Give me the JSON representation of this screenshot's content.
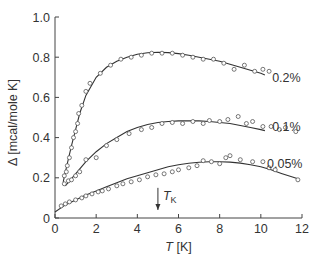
{
  "chart_data": {
    "type": "scatter",
    "title": "",
    "xlabel": "T [K]",
    "xlabel_italic": "T",
    "xlabel_unit": " [K]",
    "ylabel": "Δ [mcal/mole K]",
    "xlim": [
      0,
      12
    ],
    "ylim": [
      0,
      1.0
    ],
    "xticks": [
      0,
      2,
      4,
      6,
      8,
      10,
      12
    ],
    "xtick_labels": [
      "0",
      "2",
      "4",
      "6",
      "8",
      "10",
      "12"
    ],
    "yticks": [
      0,
      0.2,
      0.4,
      0.6,
      0.8,
      1.0
    ],
    "ytick_labels": [
      "0",
      "0.2",
      "0.4",
      "0.6",
      "0.8",
      "1.0"
    ],
    "grid": false,
    "annotations": [
      {
        "text": "T",
        "subscript": "K",
        "x": 5.0,
        "y_from": 0.15,
        "y_to": 0.04,
        "type": "arrow-down"
      }
    ],
    "series": [
      {
        "name": "0.2%",
        "points": [
          [
            0.45,
            0.21
          ],
          [
            0.55,
            0.23
          ],
          [
            0.6,
            0.26
          ],
          [
            0.7,
            0.3
          ],
          [
            0.8,
            0.35
          ],
          [
            0.9,
            0.4
          ],
          [
            1.0,
            0.43
          ],
          [
            1.1,
            0.47
          ],
          [
            1.15,
            0.52
          ],
          [
            1.3,
            0.56
          ],
          [
            1.5,
            0.63
          ],
          [
            1.7,
            0.67
          ],
          [
            2.2,
            0.72
          ],
          [
            2.7,
            0.76
          ],
          [
            3.2,
            0.79
          ],
          [
            3.7,
            0.8
          ],
          [
            4.2,
            0.81
          ],
          [
            4.7,
            0.82
          ],
          [
            5.2,
            0.82
          ],
          [
            5.7,
            0.82
          ],
          [
            6.2,
            0.81
          ],
          [
            6.7,
            0.8
          ],
          [
            7.2,
            0.79
          ],
          [
            7.7,
            0.79
          ],
          [
            8.2,
            0.77
          ],
          [
            8.7,
            0.74
          ],
          [
            9.2,
            0.76
          ],
          [
            9.7,
            0.73
          ],
          [
            10.1,
            0.74
          ],
          [
            10.4,
            0.73
          ]
        ],
        "curve": [
          [
            0.4,
            0.18
          ],
          [
            0.6,
            0.27
          ],
          [
            0.8,
            0.36
          ],
          [
            1.0,
            0.44
          ],
          [
            1.2,
            0.52
          ],
          [
            1.5,
            0.61
          ],
          [
            2.0,
            0.7
          ],
          [
            2.5,
            0.75
          ],
          [
            3.0,
            0.78
          ],
          [
            3.5,
            0.8
          ],
          [
            4.0,
            0.815
          ],
          [
            4.5,
            0.822
          ],
          [
            5.0,
            0.825
          ],
          [
            5.5,
            0.823
          ],
          [
            6.0,
            0.818
          ],
          [
            6.5,
            0.81
          ],
          [
            7.0,
            0.8
          ],
          [
            7.5,
            0.79
          ],
          [
            8.0,
            0.78
          ],
          [
            8.5,
            0.765
          ],
          [
            9.0,
            0.75
          ],
          [
            9.5,
            0.735
          ],
          [
            10.0,
            0.72
          ],
          [
            10.2,
            0.712
          ]
        ],
        "label_x": 10.55,
        "label_y": 0.7
      },
      {
        "name": "0.1%",
        "points": [
          [
            0.45,
            0.17
          ],
          [
            0.65,
            0.185
          ],
          [
            0.8,
            0.19
          ],
          [
            1.0,
            0.21
          ],
          [
            1.2,
            0.23
          ],
          [
            1.5,
            0.29
          ],
          [
            2.0,
            0.3
          ],
          [
            2.5,
            0.36
          ],
          [
            3.0,
            0.39
          ],
          [
            3.6,
            0.42
          ],
          [
            4.2,
            0.44
          ],
          [
            4.7,
            0.45
          ],
          [
            5.2,
            0.47
          ],
          [
            5.7,
            0.475
          ],
          [
            6.2,
            0.47
          ],
          [
            6.7,
            0.48
          ],
          [
            7.2,
            0.47
          ],
          [
            7.5,
            0.485
          ],
          [
            8.0,
            0.48
          ],
          [
            8.4,
            0.49
          ],
          [
            8.9,
            0.505
          ],
          [
            9.3,
            0.47
          ],
          [
            9.6,
            0.48
          ],
          [
            10.1,
            0.455
          ],
          [
            10.5,
            0.455
          ],
          [
            10.9,
            0.44
          ],
          [
            11.2,
            0.45
          ],
          [
            11.7,
            0.43
          ]
        ],
        "curve": [
          [
            0.5,
            0.16
          ],
          [
            1.0,
            0.22
          ],
          [
            1.5,
            0.28
          ],
          [
            2.0,
            0.33
          ],
          [
            2.5,
            0.37
          ],
          [
            3.0,
            0.4
          ],
          [
            3.5,
            0.43
          ],
          [
            4.0,
            0.45
          ],
          [
            4.5,
            0.465
          ],
          [
            5.0,
            0.475
          ],
          [
            5.5,
            0.48
          ],
          [
            6.0,
            0.483
          ],
          [
            6.5,
            0.484
          ],
          [
            7.0,
            0.483
          ],
          [
            7.5,
            0.48
          ],
          [
            8.0,
            0.475
          ],
          [
            8.5,
            0.47
          ],
          [
            9.0,
            0.46
          ],
          [
            9.5,
            0.45
          ],
          [
            10.0,
            0.44
          ],
          [
            10.2,
            0.435
          ]
        ],
        "label_x": 10.55,
        "label_y": 0.46
      },
      {
        "name": "0.05%",
        "points": [
          [
            0.3,
            0.06
          ],
          [
            0.5,
            0.07
          ],
          [
            0.7,
            0.08
          ],
          [
            1.0,
            0.09
          ],
          [
            1.3,
            0.1
          ],
          [
            1.5,
            0.11
          ],
          [
            1.8,
            0.12
          ],
          [
            2.1,
            0.13
          ],
          [
            2.3,
            0.135
          ],
          [
            2.6,
            0.145
          ],
          [
            3.0,
            0.16
          ],
          [
            3.3,
            0.17
          ],
          [
            3.7,
            0.18
          ],
          [
            4.1,
            0.19
          ],
          [
            4.5,
            0.205
          ],
          [
            4.9,
            0.215
          ],
          [
            5.3,
            0.22
          ],
          [
            5.7,
            0.23
          ],
          [
            6.0,
            0.24
          ],
          [
            6.5,
            0.25
          ],
          [
            6.9,
            0.26
          ],
          [
            7.2,
            0.285
          ],
          [
            7.6,
            0.28
          ],
          [
            8.0,
            0.27
          ],
          [
            8.3,
            0.3
          ],
          [
            8.5,
            0.31
          ],
          [
            9.0,
            0.29
          ],
          [
            9.6,
            0.28
          ],
          [
            10.1,
            0.28
          ],
          [
            10.4,
            0.25
          ],
          [
            10.7,
            0.24
          ],
          [
            11.8,
            0.19
          ]
        ],
        "curve": [
          [
            0.0,
            0.03
          ],
          [
            0.5,
            0.065
          ],
          [
            1.0,
            0.09
          ],
          [
            1.5,
            0.115
          ],
          [
            2.0,
            0.135
          ],
          [
            2.5,
            0.155
          ],
          [
            3.0,
            0.175
          ],
          [
            3.5,
            0.195
          ],
          [
            4.0,
            0.21
          ],
          [
            4.5,
            0.225
          ],
          [
            5.0,
            0.24
          ],
          [
            5.5,
            0.255
          ],
          [
            6.0,
            0.265
          ],
          [
            6.5,
            0.272
          ],
          [
            7.0,
            0.277
          ],
          [
            7.5,
            0.28
          ],
          [
            8.0,
            0.28
          ],
          [
            8.5,
            0.278
          ],
          [
            9.0,
            0.273
          ],
          [
            9.5,
            0.265
          ],
          [
            10.0,
            0.255
          ],
          [
            10.5,
            0.24
          ],
          [
            11.0,
            0.222
          ],
          [
            11.5,
            0.205
          ],
          [
            11.8,
            0.195
          ]
        ],
        "label_x": 10.3,
        "label_y": 0.275
      }
    ]
  }
}
